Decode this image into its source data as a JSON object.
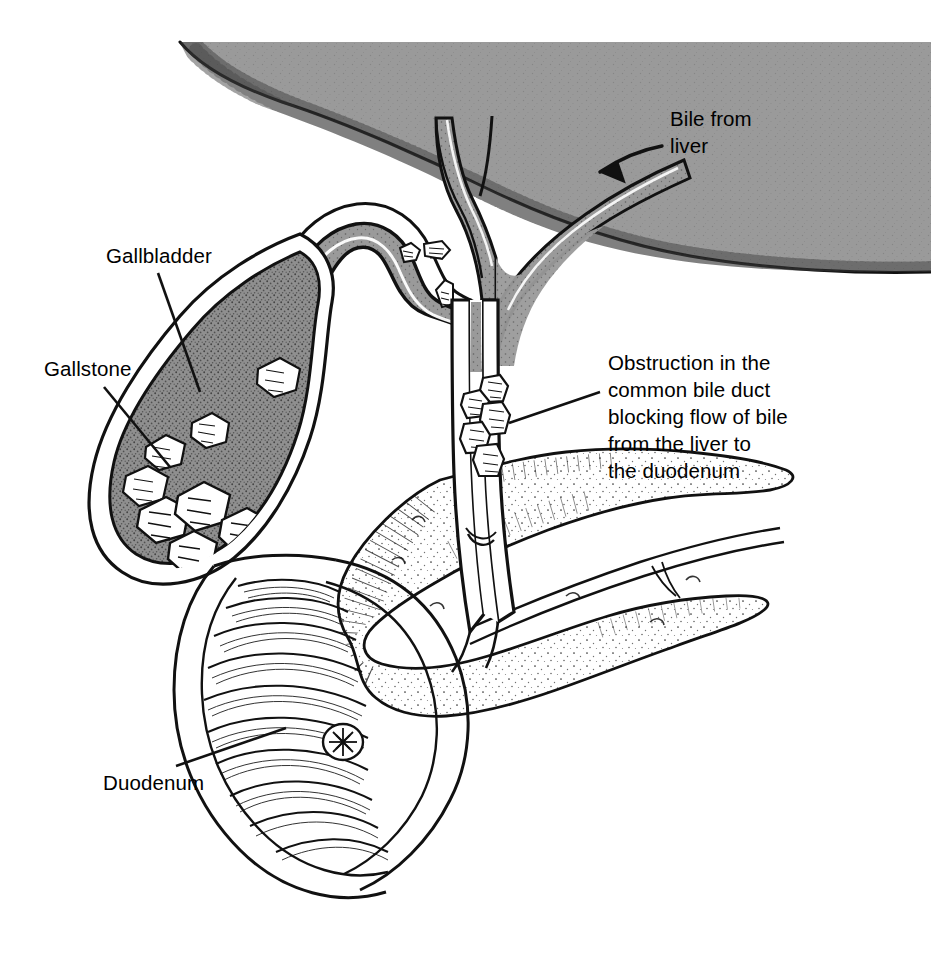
{
  "figure": {
    "background_color": "#ffffff",
    "width": 931,
    "height": 961
  },
  "colors": {
    "liver_gray": "#9a9a9a",
    "duct_lumen_gray": "#9a9a9a",
    "gallbladder_fill": "#8f8f8f",
    "stone_white": "#ffffff",
    "outline_black": "#000000",
    "stipple_black": "#1a1a1a",
    "paper_white": "#ffffff"
  },
  "labels": {
    "bile_from_liver": {
      "name": "Bile from liver",
      "lines": [
        "Bile from",
        "liver"
      ],
      "line1": "Bile from",
      "line2": "liver",
      "x": 670,
      "y": 126,
      "pointer": "curved-arrow-down-left"
    },
    "gallbladder": {
      "name": "Gallbladder",
      "line1": "Gallbladder",
      "x": 106,
      "y": 263,
      "pointer": "leader-line-down-right"
    },
    "gallstone": {
      "name": "Gallstone",
      "line1": "Gallstone",
      "x": 44,
      "y": 376,
      "pointer": "leader-line-down-right"
    },
    "obstruction": {
      "name": "Obstruction in the common bile duct blocking flow of bile from the liver to the duodenum",
      "lines": [
        "Obstruction in the",
        "common bile duct",
        "blocking flow of bile",
        "from the liver to",
        "the duodenum"
      ],
      "line1": "Obstruction in the",
      "line2": "common bile duct",
      "line3": "blocking flow of bile",
      "line4": "from the liver to",
      "line5": "the duodenum",
      "x": 608,
      "y": 370,
      "pointer": "leader-line-left-down"
    },
    "duodenum": {
      "name": "Duodenum",
      "line1": "Duodenum",
      "x": 103,
      "y": 790,
      "pointer": "leader-line-up-right"
    }
  },
  "structures": {
    "liver": "liver",
    "right_hepatic_duct": "right hepatic duct",
    "left_hepatic_duct": "left hepatic duct",
    "common_hepatic_duct": "common hepatic duct",
    "cystic_duct": "cystic duct",
    "common_bile_duct": "common bile duct",
    "gallbladder": "gallbladder",
    "pancreas": "pancreas",
    "pancreatic_duct": "pancreatic duct",
    "duodenum": "duodenum",
    "ampulla_of_vater": "ampulla of Vater",
    "gallstones_in_gallbladder": "gallstones in gallbladder",
    "gallstones_in_cystic_duct": "gallstones in cystic duct",
    "gallstones_obstructing_duct": "gallstones obstructing common bile duct"
  },
  "counts": {
    "gallstones_in_gallbladder": 8,
    "gallstones_in_cystic_duct": 3,
    "gallstones_in_obstruction": 5
  }
}
